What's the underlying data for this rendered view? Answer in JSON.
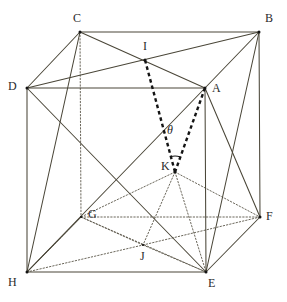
{
  "figure": {
    "type": "geometry-diagram",
    "width": 287,
    "height": 302,
    "background_color": "#ffffff",
    "stroke_color": "#4a4638",
    "hidden_stroke_color": "#5a5648",
    "emphasis_stroke_color": "#141414",
    "label_color": "#2b2b2b"
  },
  "angle": {
    "symbol": "θ",
    "at_vertex": "K",
    "between_rays": [
      "K-I",
      "K-A"
    ],
    "label_x": 167,
    "label_y": 124
  },
  "vertices": [
    {
      "name": "C",
      "x": 80,
      "y": 32,
      "label": "C",
      "label_x": 73,
      "label_y": 12,
      "hidden": false
    },
    {
      "name": "B",
      "x": 259,
      "y": 32,
      "label": "B",
      "label_x": 265,
      "label_y": 12,
      "hidden": false
    },
    {
      "name": "D",
      "x": 27,
      "y": 88,
      "label": "D",
      "label_x": 8,
      "label_y": 80,
      "hidden": false
    },
    {
      "name": "A",
      "x": 205,
      "y": 88,
      "label": "A",
      "label_x": 212,
      "label_y": 82,
      "hidden": false
    },
    {
      "name": "G",
      "x": 81,
      "y": 217,
      "label": "G",
      "label_x": 88,
      "label_y": 208,
      "hidden": true
    },
    {
      "name": "F",
      "x": 260,
      "y": 217,
      "label": "F",
      "label_x": 266,
      "label_y": 210,
      "hidden": false
    },
    {
      "name": "H",
      "x": 27,
      "y": 272,
      "label": "H",
      "label_x": 8,
      "label_y": 276,
      "hidden": false
    },
    {
      "name": "E",
      "x": 206,
      "y": 272,
      "label": "E",
      "label_x": 208,
      "label_y": 277,
      "hidden": false
    },
    {
      "name": "I",
      "x": 145,
      "y": 60,
      "label": "I",
      "label_x": 143,
      "label_y": 40,
      "hidden": false
    },
    {
      "name": "J",
      "x": 143,
      "y": 245,
      "label": "J",
      "label_x": 140,
      "label_y": 250,
      "hidden": true
    },
    {
      "name": "K",
      "x": 175,
      "y": 172,
      "label": "K",
      "label_x": 161,
      "label_y": 160,
      "hidden": false
    }
  ],
  "edges_solid": [
    {
      "from": "C",
      "to": "B",
      "name": "edge-C-B"
    },
    {
      "from": "C",
      "to": "D",
      "name": "edge-C-D"
    },
    {
      "from": "D",
      "to": "A",
      "name": "edge-D-A"
    },
    {
      "from": "A",
      "to": "B",
      "name": "edge-A-B"
    },
    {
      "from": "D",
      "to": "H",
      "name": "edge-D-H"
    },
    {
      "from": "B",
      "to": "F",
      "name": "edge-B-F"
    },
    {
      "from": "A",
      "to": "E",
      "name": "edge-A-E"
    },
    {
      "from": "H",
      "to": "E",
      "name": "edge-H-E"
    },
    {
      "from": "E",
      "to": "F",
      "name": "edge-E-F"
    }
  ],
  "edges_hidden": [
    {
      "from": "C",
      "to": "G",
      "name": "edge-C-G"
    },
    {
      "from": "G",
      "to": "H",
      "name": "edge-G-H"
    },
    {
      "from": "G",
      "to": "F",
      "name": "edge-G-F"
    }
  ],
  "diagonals_solid": [
    {
      "from": "C",
      "to": "A",
      "name": "diagonal-C-A"
    },
    {
      "from": "D",
      "to": "B",
      "name": "diagonal-D-B"
    },
    {
      "from": "D",
      "to": "E",
      "name": "diagonal-D-E"
    },
    {
      "from": "H",
      "to": "A",
      "name": "diagonal-H-A"
    },
    {
      "from": "A",
      "to": "F",
      "name": "diagonal-A-F"
    },
    {
      "from": "B",
      "to": "E",
      "name": "diagonal-B-E"
    },
    {
      "from": "H",
      "to": "G",
      "name": "diagonal-H-G"
    },
    {
      "from": "C",
      "to": "H",
      "name": "diagonal-C-H"
    }
  ],
  "diagonals_hidden": [
    {
      "from": "G",
      "to": "E",
      "name": "diagonal-G-E"
    },
    {
      "from": "H",
      "to": "J",
      "name": "diagonal-H-J"
    },
    {
      "from": "J",
      "to": "E",
      "name": "diagonal-J-E"
    },
    {
      "from": "G",
      "to": "J",
      "name": "diagonal-G-J"
    },
    {
      "from": "J",
      "to": "F",
      "name": "diagonal-J-F"
    },
    {
      "from": "K",
      "to": "G",
      "name": "diagonal-K-G"
    },
    {
      "from": "K",
      "to": "J",
      "name": "diagonal-K-J"
    },
    {
      "from": "K",
      "to": "E",
      "name": "diagonal-K-E"
    },
    {
      "from": "K",
      "to": "F",
      "name": "diagonal-K-F"
    }
  ],
  "emphasis_lines": [
    {
      "from": "I",
      "to": "K",
      "name": "ray-I-K"
    },
    {
      "from": "A",
      "to": "K",
      "name": "ray-A-K"
    }
  ]
}
